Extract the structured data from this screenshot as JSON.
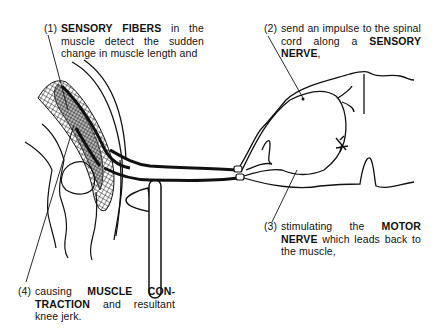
{
  "diagram": {
    "colors": {
      "ink": "#111111",
      "background": "#ffffff"
    },
    "captions": [
      {
        "number": "(1)",
        "parts": [
          {
            "text": "SENSORY FIBERS",
            "bold": true
          },
          {
            "text": " in the muscle detect the sudden change in muscle length and",
            "bold": false
          }
        ]
      },
      {
        "number": "(2)",
        "parts": [
          {
            "text": "send an impulse to the spinal cord along a ",
            "bold": false
          },
          {
            "text": "SENSORY NERVE",
            "bold": true
          },
          {
            "text": ",",
            "bold": false
          }
        ]
      },
      {
        "number": "(3)",
        "parts": [
          {
            "text": "stimulating the ",
            "bold": false
          },
          {
            "text": "MOTOR NERVE",
            "bold": true
          },
          {
            "text": " which leads back to the muscle,",
            "bold": false
          }
        ]
      },
      {
        "number": "(4)",
        "parts": [
          {
            "text": "causing ",
            "bold": false
          },
          {
            "text": "MUSCLE CON-TRACTION",
            "bold": true
          },
          {
            "text": " and resultant knee jerk.",
            "bold": false
          }
        ]
      }
    ],
    "labels": {
      "c1_num": "(1)",
      "c1_bold": "SENSORY FIBERS",
      "c1_rest": " in the muscle detect the sudden change in muscle length and",
      "c2_num": "(2)",
      "c2_pre": "send an impulse to the spinal cord along a ",
      "c2_bold": "SENSORY NERVE",
      "c2_post": ",",
      "c3_num": "(3)",
      "c3_pre": "stimulating the ",
      "c3_bold": "MOTOR NERVE",
      "c3_post": " which leads back to the muscle,",
      "c4_num": "(4)",
      "c4_pre": "causing ",
      "c4_bold": "MUSCLE CON-TRACTION",
      "c4_post": " and resultant knee jerk."
    },
    "structures": [
      {
        "name": "quadriceps-muscle",
        "style": "crosshatched"
      },
      {
        "name": "patella"
      },
      {
        "name": "reflex-hammer"
      },
      {
        "name": "sensory-nerve"
      },
      {
        "name": "motor-nerve"
      },
      {
        "name": "dorsal-root-ganglion"
      },
      {
        "name": "spinal-cord-section"
      }
    ]
  }
}
